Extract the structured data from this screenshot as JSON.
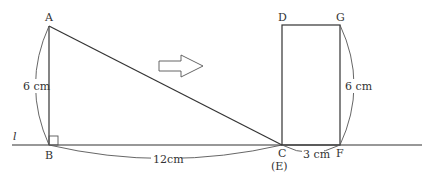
{
  "figure": {
    "line_label": "l",
    "triangle": {
      "vertices": {
        "A": "A",
        "B": "B",
        "C": "C"
      },
      "height_label": "6 cm",
      "base_label": "12cm",
      "right_angle_at": "B"
    },
    "rectangle": {
      "vertices": {
        "D": "D",
        "G": "G",
        "F": "F",
        "E": "(E)"
      },
      "height_label": "6 cm",
      "width_label": "3 cm"
    },
    "arrow": {
      "direction": "right"
    }
  }
}
